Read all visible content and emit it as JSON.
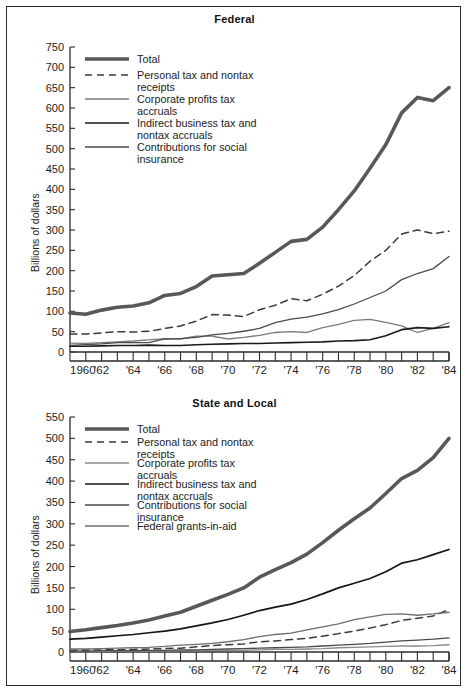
{
  "figure": {
    "ylabel": "Billions of dollars",
    "xlabel": "",
    "border_color": "#2b2b2b"
  },
  "chart_data": [
    {
      "type": "line",
      "title": "Federal",
      "xlabel": "",
      "ylabel": "Billions of dollars",
      "xlim": [
        1960,
        1984
      ],
      "ylim": [
        0,
        750
      ],
      "ytick_step": 50,
      "yticks": [
        0,
        50,
        100,
        150,
        200,
        250,
        300,
        350,
        400,
        450,
        500,
        550,
        600,
        650,
        700,
        750
      ],
      "ytick_labels": [
        "0",
        "50",
        "100",
        "150",
        "200",
        "250",
        "300",
        "350",
        "400",
        "450",
        "500",
        "550",
        "600",
        "650",
        "700",
        "750"
      ],
      "x": [
        1960,
        1961,
        1962,
        1963,
        1964,
        1965,
        1966,
        1967,
        1968,
        1969,
        1970,
        1971,
        1972,
        1973,
        1974,
        1975,
        1976,
        1977,
        1978,
        1979,
        1980,
        1981,
        1982,
        1983,
        1984
      ],
      "xticks": [
        1960,
        1961,
        1962,
        1963,
        1964,
        1965,
        1966,
        1967,
        1968,
        1969,
        1970,
        1971,
        1972,
        1973,
        1974,
        1975,
        1976,
        1977,
        1978,
        1979,
        1980,
        1981,
        1982,
        1983,
        1984
      ],
      "xtick_labels": [
        "1960",
        "",
        "'62",
        "",
        "'64",
        "",
        "'66",
        "",
        "'68",
        "",
        "'70",
        "",
        "'72",
        "",
        "'74",
        "",
        "'76",
        "",
        "'78",
        "",
        "'80",
        "",
        "'82",
        "",
        "'84"
      ],
      "grid": false,
      "legend_position": "upper left",
      "series": [
        {
          "name": "Total",
          "style": "thick-gray",
          "color": "#585858",
          "width": 3.6,
          "dash": "",
          "values": [
            96,
            93,
            103,
            110,
            113,
            121,
            139,
            144,
            161,
            187,
            190,
            193,
            218,
            245,
            272,
            277,
            307,
            350,
            396,
            452,
            510,
            588,
            626,
            618,
            650,
            716
          ]
        },
        {
          "name": "Personal tax and nontax receipts",
          "style": "dashed",
          "color": "#3a3a3a",
          "width": 1.5,
          "dash": "7,5",
          "values": [
            44,
            44,
            47,
            50,
            49,
            51,
            58,
            64,
            76,
            92,
            91,
            87,
            104,
            115,
            131,
            126,
            142,
            162,
            188,
            223,
            250,
            290,
            300,
            291,
            297,
            320
          ]
        },
        {
          "name": "Corporate profits tax accruals",
          "style": "thin-gray",
          "color": "#7a7a7a",
          "width": 1.3,
          "dash": "",
          "values": [
            22,
            21,
            23,
            25,
            27,
            30,
            33,
            32,
            39,
            39,
            32,
            36,
            41,
            48,
            50,
            48,
            60,
            68,
            78,
            80,
            73,
            64,
            48,
            58,
            72,
            78
          ]
        },
        {
          "name": "Indirect business tax and nontax accruals",
          "style": "thin-black",
          "color": "#1a1a1a",
          "width": 1.6,
          "dash": "",
          "values": [
            14,
            14,
            15,
            16,
            16,
            17,
            16,
            16,
            18,
            19,
            20,
            21,
            21,
            22,
            23,
            24,
            25,
            27,
            28,
            30,
            40,
            55,
            60,
            58,
            62,
            65
          ]
        },
        {
          "name": "Contributions for social insurance",
          "style": "thin",
          "color": "#4a4a4a",
          "width": 1.3,
          "dash": "",
          "values": [
            16,
            18,
            20,
            23,
            23,
            23,
            32,
            33,
            36,
            42,
            46,
            51,
            58,
            72,
            81,
            86,
            94,
            104,
            118,
            134,
            150,
            178,
            193,
            205,
            235,
            268
          ]
        }
      ]
    },
    {
      "type": "line",
      "title": "State and Local",
      "xlabel": "",
      "ylabel": "Billions of dollars",
      "xlim": [
        1960,
        1984
      ],
      "ylim": [
        0,
        550
      ],
      "ytick_step": 50,
      "yticks": [
        0,
        50,
        100,
        150,
        200,
        250,
        300,
        350,
        400,
        450,
        500,
        550
      ],
      "ytick_labels": [
        "0",
        "50",
        "100",
        "150",
        "200",
        "250",
        "300",
        "350",
        "400",
        "450",
        "500",
        "550"
      ],
      "x": [
        1960,
        1961,
        1962,
        1963,
        1964,
        1965,
        1966,
        1967,
        1968,
        1969,
        1970,
        1971,
        1972,
        1973,
        1974,
        1975,
        1976,
        1977,
        1978,
        1979,
        1980,
        1981,
        1982,
        1983,
        1984
      ],
      "xticks": [
        1960,
        1961,
        1962,
        1963,
        1964,
        1965,
        1966,
        1967,
        1968,
        1969,
        1970,
        1971,
        1972,
        1973,
        1974,
        1975,
        1976,
        1977,
        1978,
        1979,
        1980,
        1981,
        1982,
        1983,
        1984
      ],
      "xtick_labels": [
        "1960",
        "",
        "'62",
        "",
        "'64",
        "",
        "'66",
        "",
        "'68",
        "",
        "'70",
        "",
        "'72",
        "",
        "'74",
        "",
        "'76",
        "",
        "'78",
        "",
        "'80",
        "",
        "'82",
        "",
        "'84"
      ],
      "grid": false,
      "legend_position": "upper left",
      "series": [
        {
          "name": "Total",
          "style": "thick-gray",
          "color": "#585858",
          "width": 3.6,
          "dash": "",
          "values": [
            48,
            52,
            57,
            62,
            68,
            75,
            84,
            93,
            107,
            121,
            135,
            150,
            175,
            193,
            209,
            229,
            256,
            285,
            312,
            337,
            371,
            406,
            425,
            455,
            500,
            530
          ]
        },
        {
          "name": "Personal tax and nontax receipts",
          "style": "dashed",
          "color": "#3a3a3a",
          "width": 1.5,
          "dash": "7,5",
          "values": [
            4,
            4,
            5,
            5,
            6,
            7,
            8,
            9,
            12,
            15,
            17,
            19,
            24,
            26,
            29,
            32,
            37,
            43,
            49,
            56,
            64,
            74,
            79,
            84,
            100,
            118
          ]
        },
        {
          "name": "Corporate profits tax accruals",
          "style": "thin-gray",
          "color": "#8a8a8a",
          "width": 1.3,
          "dash": "",
          "values": [
            1,
            1,
            1,
            2,
            2,
            2,
            2,
            3,
            3,
            4,
            4,
            4,
            5,
            6,
            6,
            7,
            8,
            10,
            11,
            12,
            13,
            14,
            14,
            15,
            17,
            19
          ]
        },
        {
          "name": "Indirect business tax and nontax accruals",
          "style": "thin-black",
          "color": "#151515",
          "width": 1.7,
          "dash": "",
          "values": [
            30,
            32,
            35,
            38,
            41,
            45,
            49,
            54,
            61,
            68,
            76,
            86,
            97,
            105,
            112,
            123,
            136,
            150,
            161,
            172,
            188,
            208,
            216,
            228,
            240,
            250
          ]
        },
        {
          "name": "Contributions for social insurance",
          "style": "thin",
          "color": "#4a4a4a",
          "width": 1.3,
          "dash": "",
          "values": [
            2,
            2,
            3,
            3,
            3,
            4,
            4,
            5,
            5,
            6,
            7,
            8,
            9,
            10,
            11,
            12,
            14,
            16,
            18,
            20,
            23,
            26,
            28,
            30,
            33,
            36
          ]
        },
        {
          "name": "Federal grants-in-aid",
          "style": "thin-gray2",
          "color": "#6e6e6e",
          "width": 1.3,
          "dash": "",
          "values": [
            7,
            7,
            8,
            9,
            10,
            11,
            13,
            16,
            18,
            20,
            24,
            29,
            36,
            41,
            44,
            52,
            59,
            66,
            76,
            82,
            88,
            89,
            86,
            89,
            93,
            96
          ]
        }
      ]
    }
  ],
  "charts": {
    "federal": {
      "title": "Federal",
      "legend": [
        {
          "label_line1": "Total",
          "label_line2": ""
        },
        {
          "label_line1": "Personal tax and nontax",
          "label_line2": "receipts"
        },
        {
          "label_line1": "Corporate profits tax",
          "label_line2": "accruals"
        },
        {
          "label_line1": "Indirect business tax and",
          "label_line2": "nontax accruals"
        },
        {
          "label_line1": "Contributions for social",
          "label_line2": "insurance"
        }
      ]
    },
    "state_local": {
      "title": "State and Local",
      "legend": [
        {
          "label_line1": "Total",
          "label_line2": ""
        },
        {
          "label_line1": "Personal tax and nontax",
          "label_line2": "receipts"
        },
        {
          "label_line1": "Corporate profits tax",
          "label_line2": "accruals"
        },
        {
          "label_line1": "Indirect business tax and",
          "label_line2": "nontax accruals"
        },
        {
          "label_line1": "Contributions for social",
          "label_line2": "insurance"
        },
        {
          "label_line1": "Federal grants-in-aid",
          "label_line2": ""
        }
      ]
    }
  }
}
